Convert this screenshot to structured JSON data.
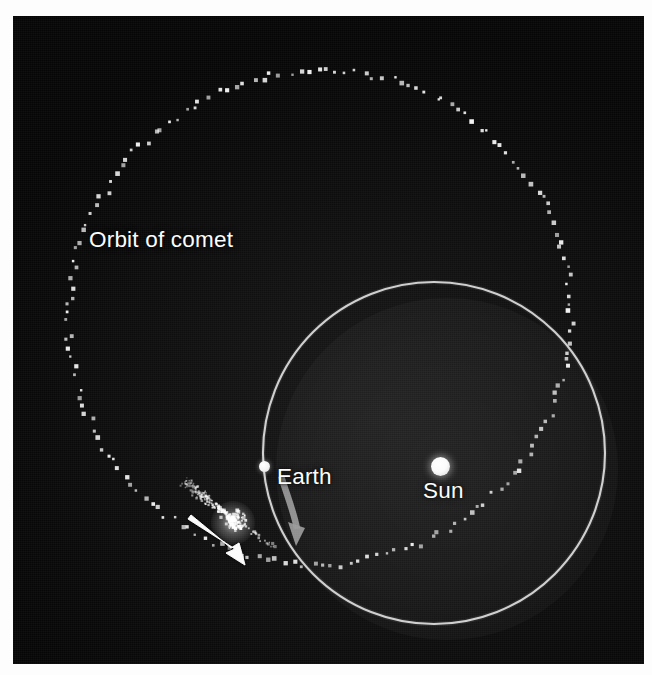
{
  "figure": {
    "kind": "astronomy-diagram",
    "background_color": "#0b0b0b",
    "page_color": "#fdfdfd"
  },
  "labels": {
    "comet_orbit": "Orbit of comet",
    "earth": "Earth",
    "sun": "Sun"
  },
  "bodies": {
    "sun": {
      "name": "Sun",
      "color": "#ffffff",
      "center_x": 436,
      "center_y": 466,
      "diameter": 19
    },
    "earth": {
      "name": "Earth",
      "color": "#ffffff",
      "center_x": 264,
      "center_y": 466,
      "diameter": 11
    },
    "comet": {
      "name": "Comet",
      "color": "#ffffff",
      "center_x": 233,
      "center_y": 520,
      "head_glow_diameter": 44,
      "tail_direction": "up-left, away from Sun"
    }
  },
  "orbits": {
    "earth_orbit": {
      "name": "Orbit of Earth",
      "style": "solid",
      "stroke_color": "#d9d9d9",
      "stroke_width": 2.2,
      "center_x": 434,
      "center_y": 453,
      "radius": 171
    },
    "comet_orbit": {
      "name": "Orbit of comet",
      "style": "dotted",
      "dot_color": "#f2f2f2",
      "dot_size": 3.2,
      "dot_count": 168,
      "shape": "ellipse",
      "center_x": 320,
      "center_y": 318,
      "semi_major": 252,
      "semi_minor": 247,
      "rotation_deg": -18
    }
  },
  "arrows": {
    "comet_motion": {
      "name": "Comet direction of travel",
      "color": "#ffffff",
      "from_x": 190,
      "from_y": 519,
      "to_x": 252,
      "to_y": 558,
      "description": "solid white arrow pointing down-right along comet path"
    },
    "earth_motion": {
      "name": "Earth direction of travel",
      "color": "#9b9b9b",
      "from_x": 286,
      "from_y": 477,
      "to_x": 303,
      "to_y": 532,
      "description": "gray curved arrow pointing downward along Earth's orbit"
    }
  },
  "chart_data": {
    "type": "scatter",
    "title": "Orbit of comet",
    "xlabel": "",
    "ylabel": "",
    "annotations": [
      "Orbit of comet",
      "Earth",
      "Sun"
    ],
    "series": [
      {
        "name": "Orbit of comet",
        "style": "dotted ellipse",
        "point_count": 168,
        "color": "#f2f2f2"
      },
      {
        "name": "Orbit of Earth",
        "style": "solid circle",
        "color": "#d9d9d9"
      }
    ]
  }
}
